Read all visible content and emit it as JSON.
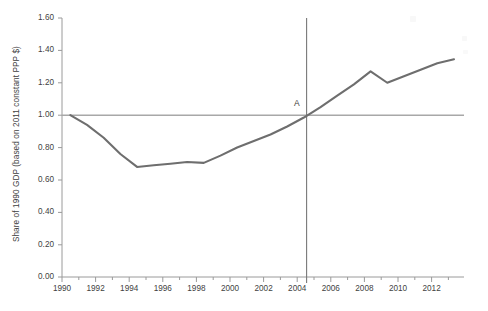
{
  "chart_data": {
    "type": "line",
    "title": "",
    "xlabel": "",
    "ylabel": "Share of 1990 GDP (based on 2011 constant PPP $)",
    "xlim": [
      1989.5,
      2013.6
    ],
    "ylim": [
      0.0,
      1.6
    ],
    "grid": false,
    "legend": "none",
    "x": [
      1990,
      1991,
      1992,
      1993,
      1994,
      1995,
      1996,
      1997,
      1998,
      1999,
      2000,
      2001,
      2002,
      2003,
      2004,
      2005,
      2006,
      2007,
      2008,
      2009,
      2010,
      2011,
      2012,
      2013
    ],
    "values": [
      1.0,
      0.94,
      0.86,
      0.76,
      0.68,
      0.69,
      0.7,
      0.71,
      0.705,
      0.75,
      0.8,
      0.84,
      0.88,
      0.93,
      0.985,
      1.05,
      1.12,
      1.19,
      1.27,
      1.2,
      1.24,
      1.28,
      1.32,
      1.345
    ],
    "series": [
      {
        "name": "Share of 1990 GDP",
        "color": "#6e6e6e",
        "values": [
          1.0,
          0.94,
          0.86,
          0.76,
          0.68,
          0.69,
          0.7,
          0.71,
          0.705,
          0.75,
          0.8,
          0.84,
          0.88,
          0.93,
          0.985,
          1.05,
          1.12,
          1.19,
          1.27,
          1.2,
          1.24,
          1.28,
          1.32,
          1.345
        ]
      }
    ],
    "ytick_labels": [
      "0.00",
      "0.20",
      "0.40",
      "0.60",
      "0.80",
      "1.00",
      "1.20",
      "1.40",
      "1.60"
    ],
    "ytick_values": [
      0.0,
      0.2,
      0.4,
      0.6,
      0.8,
      1.0,
      1.2,
      1.4,
      1.6
    ],
    "xtick_labels": [
      "1990",
      "1992",
      "1994",
      "1996",
      "1998",
      "2000",
      "2002",
      "2004",
      "2006",
      "2008",
      "2010",
      "2012"
    ],
    "xtick_values": [
      1990,
      1992,
      1994,
      1996,
      1998,
      2000,
      2002,
      2004,
      2006,
      2008,
      2010,
      2012
    ],
    "annotations": [
      {
        "label": "A",
        "kind": "point-marker",
        "x": 2004.5,
        "y": 1.0
      },
      {
        "label": "",
        "kind": "horizontal-reference-line",
        "y": 1.0,
        "color": "#a8a8a8"
      },
      {
        "label": "",
        "kind": "vertical-reference-line",
        "x": 2004.5,
        "color": "#787878"
      }
    ],
    "axis_color": "#9a9a9a",
    "series_color": "#6e6e6e"
  }
}
